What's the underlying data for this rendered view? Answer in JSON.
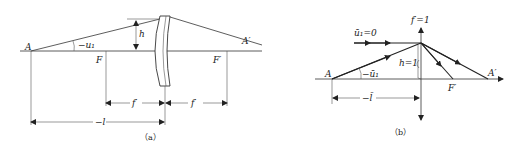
{
  "panel_a": {
    "caption": "（a）",
    "labels": {
      "A": "A",
      "A_prime": "A′",
      "F": "F",
      "F_prime": "F′",
      "h": "h",
      "angle": "−u₁",
      "f_left": "f′",
      "f_right": "f′",
      "distance": "−l"
    }
  },
  "panel_b": {
    "caption": "（b）",
    "labels": {
      "A": "A",
      "A_prime": "A′",
      "F_prime": "F′",
      "focal": "f′=1",
      "height": "h=1",
      "parallel_ray": "ū₁=0",
      "angle": "−ū₁",
      "distance": "−l̄"
    }
  }
}
